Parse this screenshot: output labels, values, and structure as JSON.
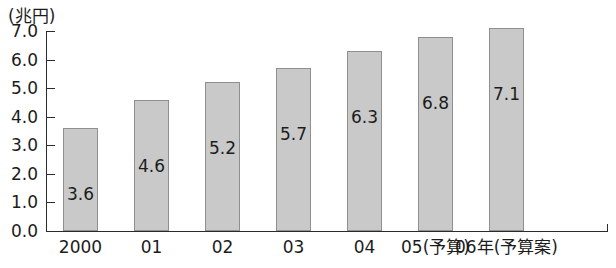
{
  "chart_data": {
    "type": "bar",
    "title": "",
    "subtitle": "",
    "unit_label": "(兆円)",
    "xlabel": "",
    "ylabel": "",
    "categories": [
      "2000",
      "01",
      "02",
      "03",
      "04",
      "05(予算)",
      "06年(予算案)"
    ],
    "values": [
      3.6,
      4.6,
      5.2,
      5.7,
      6.3,
      6.8,
      7.1
    ],
    "value_labels": [
      "3.6",
      "4.6",
      "5.2",
      "5.7",
      "6.3",
      "6.8",
      "7.1"
    ],
    "ylim": [
      0.0,
      7.0
    ],
    "ytick_labels": [
      "7.0",
      "6.0",
      "5.0",
      "4.0",
      "3.0",
      "2.0",
      "1.0",
      "0.0"
    ],
    "ytick_values": [
      7.0,
      6.0,
      5.0,
      4.0,
      3.0,
      2.0,
      1.0,
      0.0
    ],
    "grid": false,
    "legend": null,
    "legend_position": "none",
    "bar_fill_color": "#c9c9c9",
    "bar_border_color": "#8f8f8f",
    "axis_color": "#2b2b2b",
    "text_color": "#1c1c1c",
    "background_color": "#ffffff"
  }
}
